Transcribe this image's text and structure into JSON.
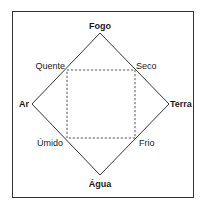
{
  "diagram": {
    "elements": {
      "top": "Fogo",
      "left": "Ar",
      "right": "Terra",
      "bottom": "Água"
    },
    "qualities": {
      "top_left": "Quente",
      "top_right": "Seco",
      "bottom_left": "Úmido",
      "bottom_right": "Frio"
    },
    "colors": {
      "line": "#333333",
      "text": "#1a1a1a",
      "background": "#ffffff"
    }
  }
}
